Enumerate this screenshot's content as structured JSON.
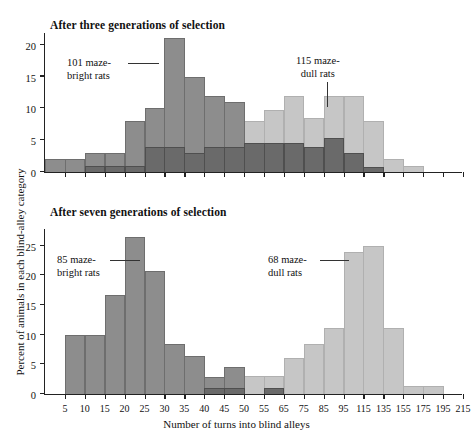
{
  "figure": {
    "xlabel": "Number of turns into blind alleys",
    "ylabel": "Percent of animals in each blind-alley category",
    "colors": {
      "maze_bright": "#8d8d8d",
      "maze_dull": "#c6c6c6",
      "overlap": "#6a6a6a",
      "axis": "#222222"
    }
  },
  "chart_data": [
    {
      "type": "bar",
      "title": "After three generations of selection",
      "xlabel": "Number of turns into blind alleys",
      "ylabel": "Percent of animals in each blind-alley category",
      "ylim": [
        0,
        22
      ],
      "yticks": [
        0,
        5,
        10,
        15,
        20
      ],
      "grid": false,
      "legend_position": "inline-annotation",
      "categories": [
        "5",
        "10",
        "15",
        "20",
        "25",
        "30",
        "35",
        "40",
        "45",
        "50",
        "55",
        "65",
        "75",
        "85",
        "95",
        "115",
        "135",
        "155",
        "175",
        "195",
        "215"
      ],
      "xticklabels": [
        "5",
        "10",
        "15",
        "20",
        "25",
        "30",
        "35",
        "40",
        "45",
        "50",
        "55",
        "65",
        "75",
        "85",
        "95",
        "115",
        "135",
        "155",
        "175",
        "195",
        "215"
      ],
      "series": [
        {
          "name": "101 maze-bright rats",
          "color": "#8d8d8d",
          "values": [
            2,
            2,
            3,
            3,
            8,
            10,
            21,
            15,
            12,
            11,
            4.5,
            4.5,
            4.5,
            4,
            5.4,
            3,
            0,
            0,
            0,
            0,
            0
          ]
        },
        {
          "name": "115 maze-dull rats",
          "color": "#c6c6c6",
          "values": [
            0,
            0,
            0,
            0,
            0,
            0,
            0,
            0,
            0,
            1,
            8,
            9.8,
            12,
            8.5,
            12,
            12,
            8,
            2,
            1,
            0,
            0
          ]
        },
        {
          "name": "overlap",
          "color": "#6a6a6a",
          "values": [
            0,
            0,
            1,
            1,
            1,
            4,
            4,
            3,
            4,
            4,
            4.5,
            4.5,
            4.5,
            4,
            5.4,
            3,
            0.8,
            0,
            0,
            0,
            0
          ]
        }
      ],
      "annotations": [
        {
          "text_line1": "101 maze-",
          "text_line2": "bright rats",
          "points_to": "peak bar at 35"
        },
        {
          "text_line1": "115 maze-",
          "text_line2": "dull rats",
          "points_to": "bar at 115"
        }
      ]
    },
    {
      "type": "bar",
      "title": "After seven generations of selection",
      "xlabel": "Number of turns into blind alleys",
      "ylabel": "Percent of animals in each blind-alley category",
      "ylim": [
        0,
        28
      ],
      "yticks": [
        0,
        5,
        10,
        15,
        20,
        25
      ],
      "grid": false,
      "legend_position": "inline-annotation",
      "categories": [
        "5",
        "10",
        "15",
        "20",
        "25",
        "30",
        "35",
        "40",
        "45",
        "50",
        "55",
        "65",
        "75",
        "85",
        "95",
        "115",
        "135",
        "155",
        "175",
        "195",
        "215"
      ],
      "xticklabels": [
        "5",
        "10",
        "15",
        "20",
        "25",
        "30",
        "35",
        "40",
        "45",
        "50",
        "55",
        "65",
        "75",
        "85",
        "95",
        "115",
        "135",
        "155",
        "175",
        "195",
        "215"
      ],
      "series": [
        {
          "name": "85 maze-bright rats",
          "color": "#8d8d8d",
          "values": [
            0,
            10,
            10,
            16.7,
            26.5,
            20.7,
            8.5,
            6.4,
            2.9,
            4.6,
            0,
            0,
            0,
            0,
            0,
            0,
            0,
            0,
            0,
            0,
            0
          ]
        },
        {
          "name": "68 maze-dull rats",
          "color": "#c6c6c6",
          "values": [
            0,
            0,
            0,
            0,
            0,
            0,
            0,
            0,
            0,
            0.6,
            3,
            3,
            6,
            8.4,
            11.1,
            24,
            25,
            11.1,
            1.3,
            1.3,
            0
          ]
        },
        {
          "name": "overlap",
          "color": "#6a6a6a",
          "values": [
            0,
            0,
            0,
            0,
            0,
            0,
            0,
            0,
            1,
            1,
            0,
            1,
            0,
            0,
            0,
            0,
            0,
            0,
            0,
            0,
            0
          ]
        }
      ],
      "annotations": [
        {
          "text_line1": "85 maze-",
          "text_line2": "bright rats",
          "points_to": "peak bar at 25"
        },
        {
          "text_line1": "68 maze-",
          "text_line2": "dull rats",
          "points_to": "peak bar at 115"
        }
      ]
    }
  ]
}
